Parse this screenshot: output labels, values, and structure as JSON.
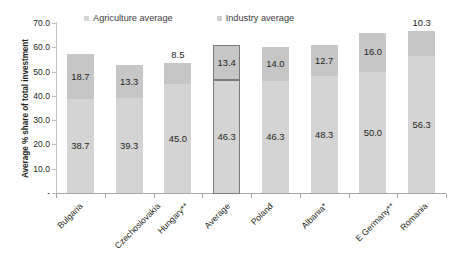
{
  "chart_data": {
    "type": "bar",
    "subtype": "stacked-column",
    "title": "",
    "xlabel": "",
    "ylabel": "Average % share of total investment",
    "ylim": [
      0,
      70
    ],
    "ytick_labels": [
      "70.0",
      "60.0",
      "50.0",
      "40.0",
      "30.0",
      "20.0",
      "10.0",
      "-"
    ],
    "ytick_values": [
      70,
      60,
      50,
      40,
      30,
      20,
      10,
      0
    ],
    "grid": false,
    "legend_position": "top",
    "categories": [
      "Bulgaria",
      "Czechoslovakia",
      "Hungary**",
      "Average",
      "Poland",
      "Albania*",
      "E Germany**",
      "Romania"
    ],
    "series": [
      {
        "name": "Agriculture average",
        "color": "#d4d4d4",
        "values": [
          38.7,
          39.3,
          45.0,
          46.3,
          46.3,
          48.3,
          50.0,
          56.3
        ],
        "labels": [
          "38.7",
          "39.3",
          "45.0",
          "46.3",
          "46.3",
          "48.3",
          "50.0",
          "56.3"
        ]
      },
      {
        "name": "Industry average",
        "color": "#c6c6c6",
        "values": [
          18.7,
          13.3,
          8.5,
          13.4,
          14.0,
          12.7,
          16.0,
          10.3
        ],
        "labels": [
          "18.7",
          "13.3",
          "8.5",
          "13.4",
          "14.0",
          "12.7",
          "16.0",
          "10.3"
        ]
      }
    ],
    "totals": [
      57.4,
      52.6,
      53.5,
      59.7,
      60.3,
      61.0,
      66.0,
      66.6
    ],
    "highlighted_category": "Average"
  },
  "legend": {
    "items": [
      {
        "label": "Agriculture average",
        "swatch": "#d4d4d4"
      },
      {
        "label": "Industry average",
        "swatch": "#cfcfcf"
      }
    ]
  }
}
